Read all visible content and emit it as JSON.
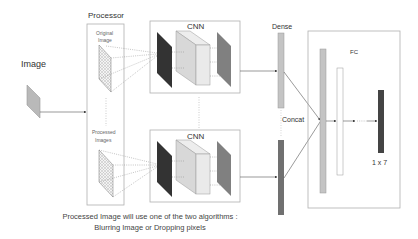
{
  "labels": {
    "image": "Image",
    "processor": "Processor",
    "original_image_line1": "Original",
    "original_image_line2": "Image",
    "processed_images_line1": "Processed",
    "processed_images_line2": "Images",
    "cnn_top": "CNN",
    "cnn_bottom": "CNN",
    "dense": "Dense",
    "concat": "Concat",
    "fc": "FC",
    "output_shape": "1 x 7"
  },
  "caption": {
    "line1": "Processed Image will use one of the two algorithms :",
    "line2": "Blurring Image or Dropping pixels"
  },
  "colors": {
    "input_image": "#b9b9b9",
    "cnn_dark_layer": "#333333",
    "cnn_cube_front": "#e8e8e8",
    "cnn_cube_side": "#d4d4d4",
    "cnn_output_layer": "#777777",
    "dense_bar": "#c4c4c4",
    "concat_bar": "#707070",
    "fc_bar_1": "#c4c4c4",
    "fc_bar_2": "#ffffff",
    "output_bar": "#444444",
    "border": "#b0b0b0"
  }
}
